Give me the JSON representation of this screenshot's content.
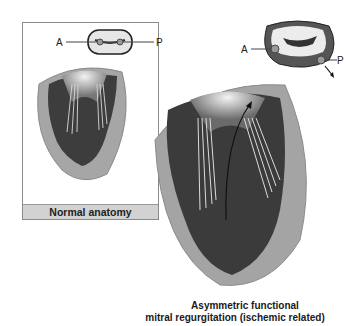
{
  "figure": {
    "left_panel": {
      "label": "Normal anatomy",
      "valve_inset": {
        "anterior_label": "A",
        "posterior_label": "P"
      }
    },
    "right_panel": {
      "caption_line1": "Asymmetric functional",
      "caption_line2": "mitral regurgitation (ischemic related)",
      "valve_inset": {
        "anterior_label": "A",
        "posterior_label": "P"
      }
    }
  },
  "colors": {
    "wall": "#a8a8a8",
    "myocardium_dark": "#3a3a3a",
    "label_band": "#d2d2d2"
  }
}
